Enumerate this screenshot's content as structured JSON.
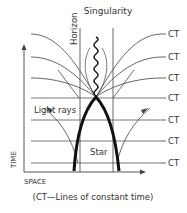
{
  "diagram": {
    "labels": {
      "singularity": "Singularity",
      "horizon": "Horizon",
      "light_rays": "Light rays",
      "star": "Star",
      "time_axis": "TIME",
      "space_axis": "SPACE"
    },
    "ct_labels": [
      "CT",
      "CT",
      "CT",
      "CT",
      "CT",
      "CT",
      "CT"
    ],
    "caption": "(CT—Lines of constant time)",
    "colors": {
      "line": "#555555",
      "star": "#111111",
      "text": "#333333"
    }
  }
}
